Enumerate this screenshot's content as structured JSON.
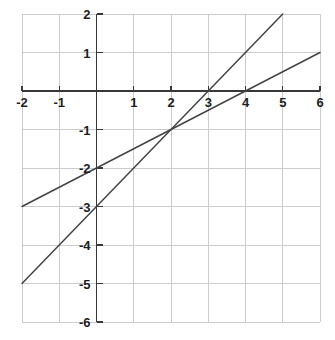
{
  "chart_data": {
    "type": "line",
    "title": "",
    "subtitle": "",
    "xlabel": "",
    "ylabel": "",
    "xlim": [
      -2,
      6
    ],
    "ylim": [
      -6,
      2
    ],
    "grid": true,
    "legend": "none",
    "xticks": [
      -2,
      -1,
      0,
      1,
      2,
      3,
      4,
      5,
      6
    ],
    "yticks": [
      2,
      1,
      0,
      -1,
      -2,
      -3,
      -4,
      -5,
      -6
    ],
    "xtick_labels": [
      "-2",
      "-1",
      "",
      "1",
      "2",
      "3",
      "4",
      "5",
      "6"
    ],
    "ytick_labels": [
      "2",
      "1",
      "",
      "-1",
      "-2",
      "-3",
      "-4",
      "-5",
      "-6"
    ],
    "x_axis_value": 0,
    "y_axis_value": 0,
    "intersection": {
      "x": 2,
      "y": -1,
      "label": "(2, -1)"
    },
    "series": [
      {
        "name": "line-steep",
        "equation": "y = x - 3",
        "slope": 1,
        "intercept": -3,
        "x_intercept": 3,
        "points": [
          {
            "x": -2,
            "y": -5
          },
          {
            "x": 0,
            "y": -3
          },
          {
            "x": 2,
            "y": -1
          },
          {
            "x": 3,
            "y": 0
          },
          {
            "x": 5,
            "y": 2
          }
        ],
        "endpoints": [
          {
            "x": -2,
            "y": -5
          },
          {
            "x": 5,
            "y": 2
          }
        ],
        "color": "#444444"
      },
      {
        "name": "line-shallow",
        "equation": "y = 0.5x - 2",
        "slope": 0.5,
        "intercept": -2,
        "x_intercept": 4,
        "points": [
          {
            "x": -2,
            "y": -3
          },
          {
            "x": 0,
            "y": -2
          },
          {
            "x": 2,
            "y": -1
          },
          {
            "x": 4,
            "y": 0
          },
          {
            "x": 6,
            "y": 1
          }
        ],
        "endpoints": [
          {
            "x": -2,
            "y": -3
          },
          {
            "x": 6,
            "y": 1
          }
        ],
        "color": "#444444"
      }
    ]
  },
  "style": {
    "background_color": "#ffffff",
    "grid_color": "#cbcbd2",
    "axis_color": "#383838",
    "line_color": "#4a4a4a",
    "tick_label_color": "#1d1d1d"
  },
  "geometry": {
    "plot_left_px": 22,
    "plot_top_px": 14,
    "plot_right_px": 320,
    "plot_bottom_px": 322,
    "unit_x_px": 37.25,
    "unit_y_px": 38.5,
    "origin_x_px": 96.5,
    "origin_y_px": 91
  }
}
